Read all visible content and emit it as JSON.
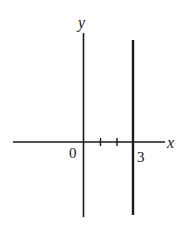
{
  "diagram": {
    "x_axis_label": "x",
    "y_axis_label": "y",
    "origin_label": "0",
    "line_label": "3",
    "line_x_value": 3,
    "tick_values": [
      1,
      2
    ],
    "colors": {
      "ink": "#1a1a1a",
      "background": "#ffffff"
    }
  }
}
